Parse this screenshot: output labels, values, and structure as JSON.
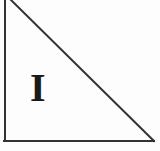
{
  "figure": {
    "type": "geometric-diagram",
    "background_color": "#fdfdfd",
    "stroke_color": "#333333",
    "stroke_width": 2,
    "width": 160,
    "height": 151,
    "shape": {
      "name": "right-triangle",
      "edges": [
        {
          "name": "left-vertical-edge",
          "x1": 5,
          "y1": 0,
          "x2": 5,
          "y2": 141
        },
        {
          "name": "bottom-horizontal-edge",
          "x1": 5,
          "y1": 141,
          "x2": 154,
          "y2": 141
        },
        {
          "name": "hypotenuse-edge",
          "x1": 11,
          "y1": 0,
          "x2": 154,
          "y2": 141
        }
      ]
    },
    "labels": [
      {
        "id": "region-label-1",
        "text": "I",
        "color": "#1a1a1a",
        "x": 30,
        "y": 68,
        "font_size": 40,
        "bold": true
      }
    ]
  }
}
